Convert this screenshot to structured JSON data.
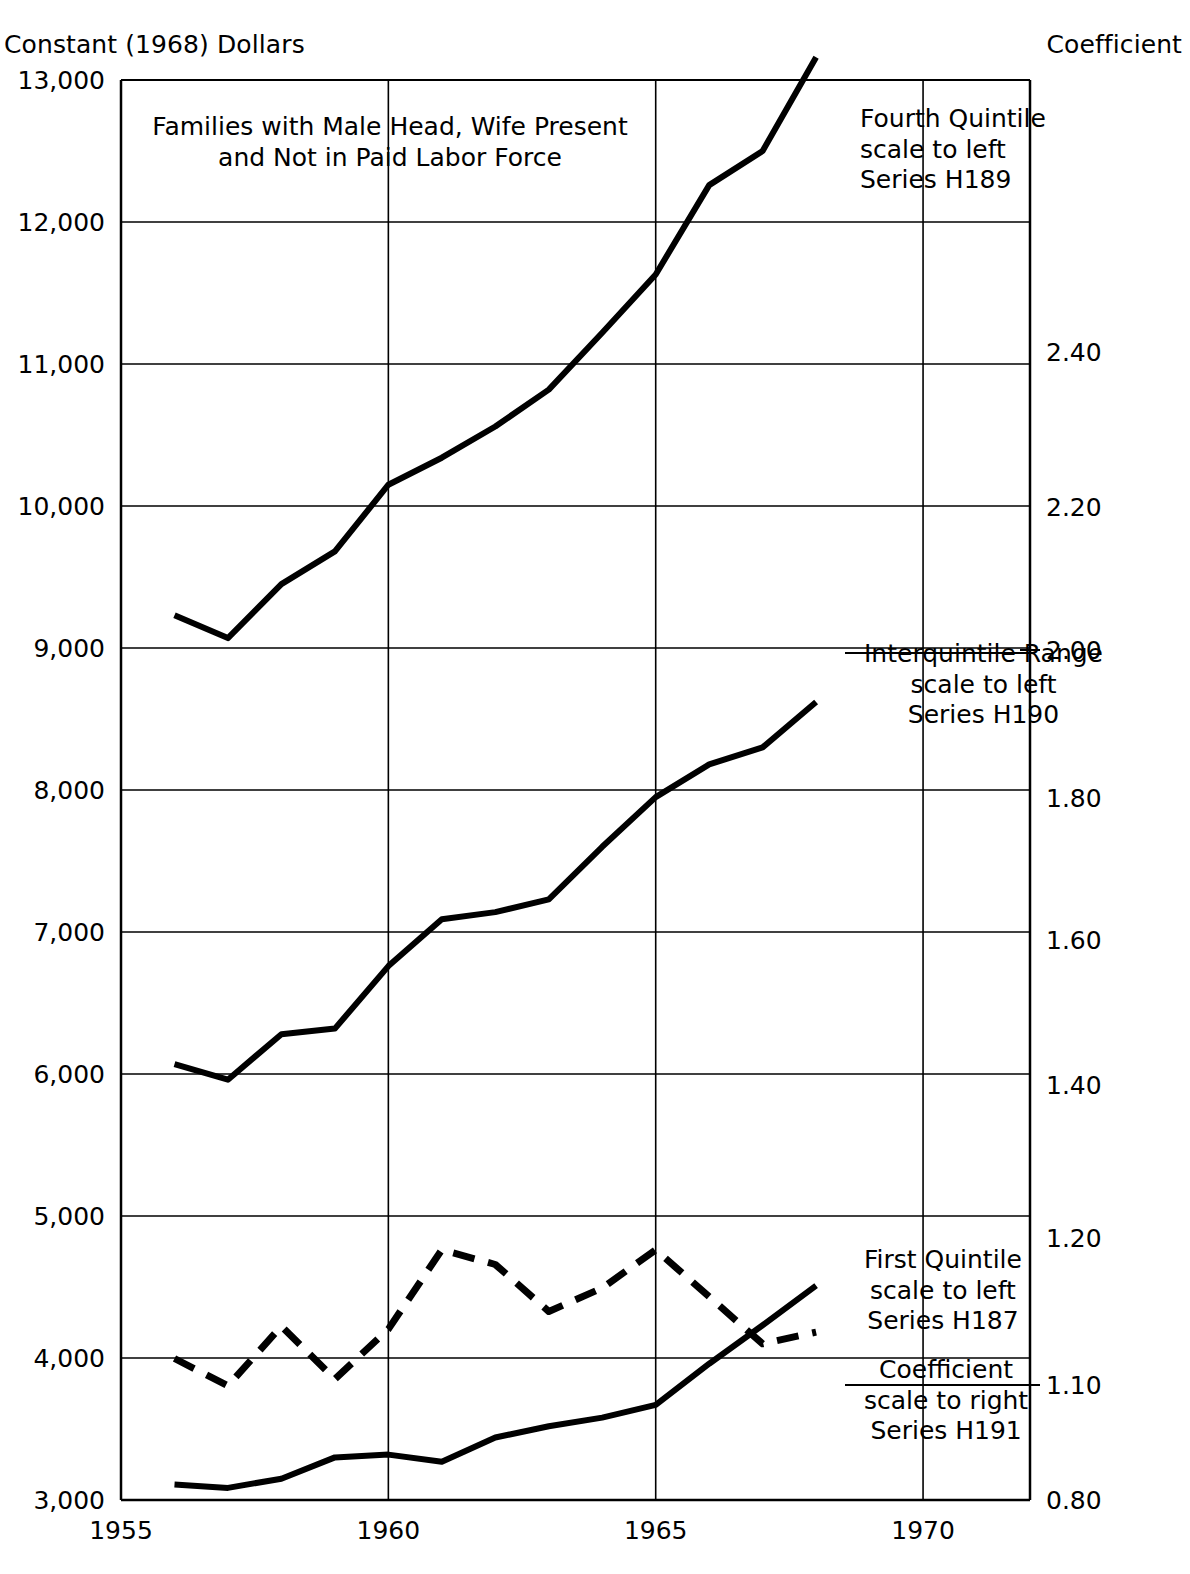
{
  "axis_titles": {
    "left": "Constant (1968) Dollars",
    "right": "Coefficient"
  },
  "plot_title": {
    "line1": "Families with Male Head, Wife Present",
    "line2": "and Not in Paid Labor Force"
  },
  "annotations": {
    "fourth_quintile": {
      "line1": "Fourth Quintile",
      "line2": "scale to left",
      "line3": "Series H189"
    },
    "interquintile": {
      "line1": "Interquintile Range",
      "line2": "scale to left",
      "line3": "Series H190"
    },
    "first_quintile": {
      "line1": "First Quintile",
      "line2": "scale to left",
      "line3": "Series H187"
    },
    "coefficient": {
      "line1": "Coefficient",
      "line2": "scale to right",
      "line3": "Series H191"
    }
  },
  "colors": {
    "ink": "#000000",
    "grid": "#000000",
    "background": "#ffffff"
  },
  "chart_data": {
    "type": "line",
    "title": "Families with Male Head, Wife Present and Not in Paid Labor Force",
    "xlabel": "",
    "ylabel": "Constant (1968) Dollars",
    "y2label": "Coefficient",
    "xlim": [
      1955,
      1972
    ],
    "ylim": [
      3000,
      13000
    ],
    "y2lim": [
      0.8,
      2.55
    ],
    "grid": true,
    "legend_position": "inside-right",
    "xticks": [
      1955,
      1960,
      1965,
      1970
    ],
    "xtick_labels": [
      "1955",
      "1960",
      "1965",
      "1970"
    ],
    "yticks": [
      3000,
      4000,
      5000,
      6000,
      7000,
      8000,
      9000,
      10000,
      11000,
      12000,
      13000
    ],
    "ytick_labels": [
      "3,000",
      "4,000",
      "5,000",
      "6,000",
      "7,000",
      "8,000",
      "9,000",
      "10,000",
      "11,000",
      "12,000",
      "13,000"
    ],
    "y2ticks": [
      0.8,
      1.1,
      1.2,
      1.4,
      1.6,
      1.8,
      2.0,
      2.2,
      2.4
    ],
    "y2tick_labels": [
      "0.80",
      "1.10",
      "1.20",
      "1.40",
      "1.60",
      "1.80",
      "2.00",
      "2.20",
      "2.40"
    ],
    "series": [
      {
        "name": "Fourth Quintile",
        "series_code": "H189",
        "scale": "left",
        "style": "solid",
        "x": [
          1956,
          1957,
          1958,
          1959,
          1960,
          1961,
          1962,
          1963,
          1964,
          1965,
          1966,
          1967,
          1968
        ],
        "values": [
          9230,
          9070,
          9450,
          9680,
          10150,
          10340,
          10560,
          10820,
          11220,
          11630,
          12260,
          12500,
          13160
        ]
      },
      {
        "name": "Interquintile Range",
        "series_code": "H190",
        "scale": "left",
        "style": "solid",
        "x": [
          1956,
          1957,
          1958,
          1959,
          1960,
          1961,
          1962,
          1963,
          1964,
          1965,
          1966,
          1967,
          1968
        ],
        "values": [
          6070,
          5960,
          6280,
          6320,
          6760,
          7090,
          7140,
          7230,
          7600,
          7950,
          8180,
          8300,
          8620
        ]
      },
      {
        "name": "First Quintile",
        "series_code": "H187",
        "scale": "left",
        "style": "solid",
        "x": [
          1956,
          1957,
          1958,
          1959,
          1960,
          1961,
          1962,
          1963,
          1964,
          1965,
          1966,
          1967,
          1968
        ],
        "values": [
          3110,
          3085,
          3150,
          3300,
          3320,
          3270,
          3440,
          3520,
          3580,
          3670,
          3960,
          4230,
          4510
        ]
      },
      {
        "name": "Coefficient",
        "series_code": "H191",
        "scale": "right",
        "style": "dashed",
        "x": [
          1956,
          1957,
          1958,
          1959,
          1960,
          1961,
          1962,
          1963,
          1964,
          1965,
          1966,
          1967,
          1968
        ],
        "values_right": [
          1.118,
          1.098,
          1.14,
          1.104,
          1.138,
          1.192,
          1.182,
          1.15,
          1.166,
          1.192,
          1.16,
          1.128,
          1.136
        ],
        "values_left_equiv": [
          4090,
          3995,
          4195,
          4020,
          4185,
          4450,
          4400,
          4250,
          4330,
          4450,
          4300,
          4230,
          4270
        ]
      }
    ]
  }
}
